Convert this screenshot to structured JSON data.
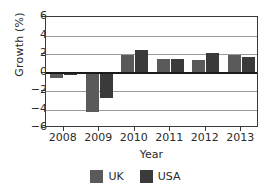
{
  "chart_data": {
    "type": "bar",
    "title": "",
    "subtitle": "",
    "xlabel": "Year",
    "ylabel": "Growth (%)",
    "categories": [
      "2008",
      "2009",
      "2010",
      "2011",
      "2012",
      "2013"
    ],
    "series": [
      {
        "name": "UK",
        "color": "#5a5a5a",
        "values": [
          -0.6,
          -4.3,
          1.9,
          1.5,
          1.4,
          1.9
        ]
      },
      {
        "name": "USA",
        "color": "#3a3a3a",
        "values": [
          -0.3,
          -2.8,
          2.4,
          1.5,
          2.1,
          1.7
        ]
      }
    ],
    "ylim": [
      -6,
      6
    ],
    "yticks": [
      6,
      4,
      2,
      0,
      -2,
      -4,
      -6
    ],
    "ytick_labels": [
      "6",
      "4",
      "2",
      "0",
      "−2",
      "−4",
      "−6"
    ],
    "grid": true,
    "grid_axis": "y",
    "zero_line": true,
    "legend_position": "bottom",
    "legend_entries": [
      "UK",
      "USA"
    ],
    "annotations": []
  },
  "axes": {
    "y_title": "Growth (%)",
    "x_title": "Year"
  },
  "legend": {
    "items": [
      {
        "label": "UK",
        "swatch_name": "legend-swatch-uk"
      },
      {
        "label": "USA",
        "swatch_name": "legend-swatch-usa"
      }
    ]
  }
}
